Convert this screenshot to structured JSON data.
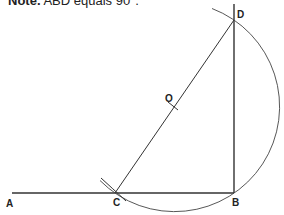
{
  "note": {
    "prefix": "Note.",
    "text": "ABD equals 90°."
  },
  "diagram": {
    "points": {
      "A": {
        "label": "A",
        "x": 8,
        "y": 193
      },
      "B": {
        "label": "B",
        "x": 234,
        "y": 193
      },
      "C": {
        "label": "C",
        "x": 115,
        "y": 193
      },
      "D": {
        "label": "D",
        "x": 234,
        "y": 20
      },
      "O": {
        "label": "O",
        "x": 174.5,
        "y": 106.5
      }
    },
    "circle_radius": 105,
    "stroke_color": "#333333"
  }
}
